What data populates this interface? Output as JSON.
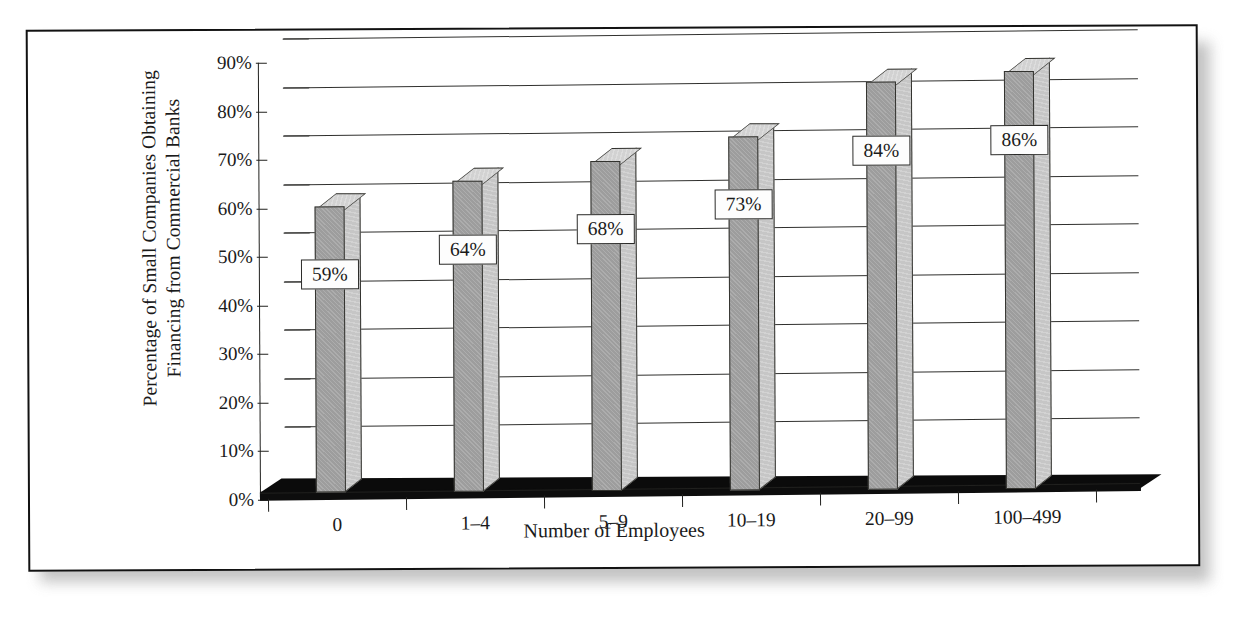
{
  "chart_data": {
    "type": "bar",
    "title": "",
    "subtitle": "",
    "xlabel": "Number of Employees",
    "ylabel": "Percentage of Small Companies Obtaining Financing from Commercial Banks",
    "ylabel_line1": "Percentage of Small Companies Obtaining",
    "ylabel_line2": "Financing from Commercial Banks",
    "categories": [
      "0",
      "1–4",
      "5–9",
      "10–19",
      "20–99",
      "100–499"
    ],
    "values": [
      59,
      64,
      68,
      73,
      84,
      86
    ],
    "value_labels": [
      "59%",
      "64%",
      "68%",
      "73%",
      "84%",
      "86%"
    ],
    "ylim": [
      0,
      90
    ],
    "ytick_values": [
      0,
      10,
      20,
      30,
      40,
      50,
      60,
      70,
      80,
      90
    ],
    "ytick_labels": [
      "0%",
      "10%",
      "20%",
      "30%",
      "40%",
      "50%",
      "60%",
      "70%",
      "80%",
      "90%"
    ],
    "grid": true,
    "grid_axis": "y",
    "legend": false,
    "legend_position": "none",
    "style": "3d-column",
    "colors": {
      "bar_front": "#9d9d9d",
      "bar_side": "#c6c6c6",
      "bar_top": "#d2d2d2",
      "floor": "#0b0b0b",
      "outline": "#33332f",
      "gridline": "#30302e",
      "label_box_fill": "#fdfdfd",
      "label_box_border": "#2a2a28",
      "frame_border": "#121212",
      "background": "#ffffff"
    }
  }
}
